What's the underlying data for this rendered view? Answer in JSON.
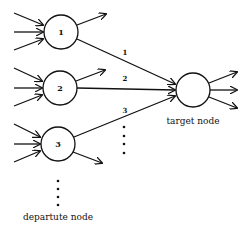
{
  "diagram": {
    "departure_nodes": [
      {
        "id": "1",
        "label": "1",
        "cx": 61,
        "cy": 32
      },
      {
        "id": "2",
        "label": "2",
        "cx": 60,
        "cy": 88
      },
      {
        "id": "3",
        "label": "3",
        "cx": 58,
        "cy": 144
      }
    ],
    "target_node": {
      "cx": 193,
      "cy": 90,
      "label": "target node"
    },
    "edges": [
      {
        "from": "1",
        "label": "1"
      },
      {
        "from": "2",
        "label": "2"
      },
      {
        "from": "3",
        "label": "3"
      }
    ],
    "departure_label": "departute node",
    "colors": {
      "stroke": "#111111",
      "background": "#ffffff"
    }
  }
}
